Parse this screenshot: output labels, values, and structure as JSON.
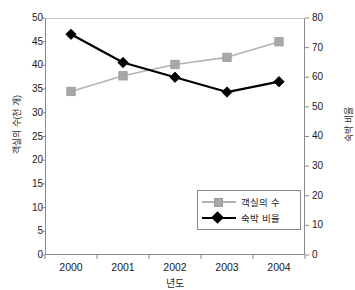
{
  "chart_data": {
    "type": "line",
    "title": "",
    "xlabel": "년도",
    "categories": [
      "2000",
      "2001",
      "2002",
      "2003",
      "2004"
    ],
    "grid": false,
    "legend_position": "inside-bottom-right",
    "axes": {
      "left": {
        "label": "객실의 수(천 개)",
        "min": 0,
        "max": 50,
        "step": 5,
        "ticks": [
          "0",
          "5",
          "10",
          "15",
          "20",
          "25",
          "30",
          "35",
          "40",
          "45",
          "50"
        ]
      },
      "right": {
        "label": "숙박 비율",
        "min": 0,
        "max": 80,
        "step": 10,
        "ticks": [
          "0",
          "10",
          "20",
          "30",
          "40",
          "50",
          "60",
          "70",
          "80"
        ]
      }
    },
    "series": [
      {
        "name": "객실의 수",
        "axis": "left",
        "marker": "square",
        "color": "#a8a8a8",
        "line_color": "#b3b3b3",
        "values": [
          34.5,
          37.8,
          40.2,
          41.7,
          45.0
        ]
      },
      {
        "name": "숙박 비율",
        "axis": "right",
        "marker": "diamond",
        "color": "#000000",
        "line_color": "#000000",
        "values": [
          74.5,
          65.0,
          60.0,
          55.0,
          58.5
        ]
      }
    ]
  }
}
